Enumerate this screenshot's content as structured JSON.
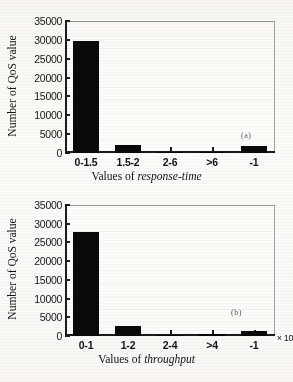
{
  "figure": {
    "panels": [
      {
        "tag": "(a)",
        "ylabel": "Number of QoS value",
        "xlabel_prefix": "Values of ",
        "xlabel_emphasis": "response-time",
        "multiplier": "",
        "ytick_labels": [
          "0",
          "5000",
          "10000",
          "15000",
          "20000",
          "25000",
          "30000",
          "35000"
        ]
      },
      {
        "tag": "(b)",
        "ylabel": "Number of QoS value",
        "xlabel_prefix": "Values of ",
        "xlabel_emphasis": "throughput",
        "multiplier": "× 10",
        "multiplier_exp": "2",
        "ytick_labels": [
          "0",
          "5000",
          "10000",
          "15000",
          "20000",
          "25000",
          "30000",
          "35000"
        ]
      }
    ]
  },
  "chart_data": [
    {
      "type": "bar",
      "title": "",
      "panel": "(a)",
      "categories": [
        "0-1.5",
        "1.5-2",
        "2-6",
        ">6",
        "-1"
      ],
      "values": [
        29800,
        2000,
        150,
        400,
        1900
      ],
      "xlabel": "Values of response-time",
      "ylabel": "Number of QoS value",
      "ylim": [
        0,
        35000
      ],
      "yticks": [
        0,
        5000,
        10000,
        15000,
        20000,
        25000,
        30000,
        35000
      ],
      "grid": false,
      "legend": false,
      "bar_color": "#090909",
      "annotations": [
        "(a)"
      ]
    },
    {
      "type": "bar",
      "title": "",
      "panel": "(b)",
      "categories": [
        "0-1",
        "1-2",
        "2-4",
        ">4",
        "-1"
      ],
      "values": [
        27700,
        2600,
        200,
        550,
        1400
      ],
      "xlabel": "Values of throughput",
      "ylabel": "Number of QoS value",
      "ylim": [
        0,
        35000
      ],
      "yticks": [
        0,
        5000,
        10000,
        15000,
        20000,
        25000,
        30000,
        35000
      ],
      "grid": false,
      "legend": false,
      "bar_color": "#090909",
      "x_axis_multiplier": "× 10²",
      "annotations": [
        "(b)"
      ]
    }
  ]
}
